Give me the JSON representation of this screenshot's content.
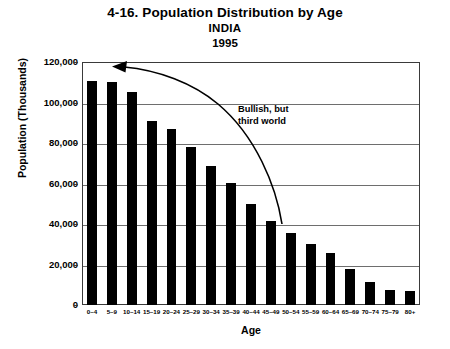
{
  "titles": {
    "main": "4-16. Population Distribution by Age",
    "country": "INDIA",
    "year": "1995"
  },
  "annotation": {
    "line1": "Bullish, but",
    "line2": "third world"
  },
  "chart_data": {
    "type": "bar",
    "title": "4-16. Population Distribution by Age",
    "subtitle": "INDIA 1995",
    "xlabel": "Age",
    "ylabel": "Population (Thousands)",
    "ylim": [
      0,
      120000
    ],
    "ytick_labels": [
      "120,000",
      "100,000",
      "80,000",
      "60,000",
      "40,000",
      "20,000",
      "0"
    ],
    "ytick_values": [
      120000,
      100000,
      80000,
      60000,
      40000,
      20000,
      0
    ],
    "grid": true,
    "legend": false,
    "bar_color": "#000000",
    "categories": [
      "0–4",
      "5–9",
      "10–14",
      "15–19",
      "20–24",
      "25–29",
      "30–34",
      "35–39",
      "40–44",
      "45–49",
      "50–54",
      "55–59",
      "60–64",
      "65–69",
      "70–74",
      "75–79",
      "80+"
    ],
    "values": [
      110500,
      110000,
      105000,
      91000,
      87000,
      78000,
      68500,
      60500,
      50000,
      41500,
      35500,
      30000,
      25500,
      18000,
      11500,
      7500,
      7000
    ],
    "annotations": [
      {
        "text": "Bullish, but third world",
        "arrow": "curved arrow pointing from the 45–49 bar up-left toward the 0–4 bar"
      }
    ]
  }
}
